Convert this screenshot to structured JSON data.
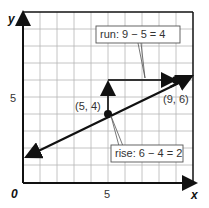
{
  "diagram": {
    "axes": {
      "x_label": "x",
      "y_label": "y",
      "origin_label": "0",
      "x_tick": "5",
      "y_tick": "5"
    },
    "points": [
      {
        "label": "(5, 4)",
        "x": 5,
        "y": 4
      },
      {
        "label": "(9, 6)",
        "x": 9,
        "y": 6
      }
    ],
    "callouts": {
      "run": "run: 9 − 5 = 4",
      "rise": "rise: 6 − 4 = 2"
    },
    "grid": {
      "x_range": [
        0,
        10
      ],
      "y_range": [
        0,
        10
      ],
      "step": 1
    },
    "colors": {
      "line": "#111111",
      "grid": "#b5b5b5",
      "axis": "#111111"
    }
  }
}
